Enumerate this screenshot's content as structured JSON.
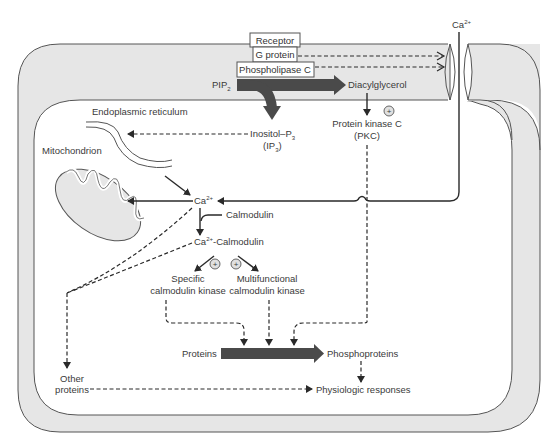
{
  "diagram": {
    "colors": {
      "membrane_band": "#e6e6e6",
      "outline": "#555555",
      "thick_arrow": "#4a4a4a",
      "text": "#3a3a3a"
    },
    "membrane_complex": {
      "receptor": "Receptor",
      "g_protein": "G protein",
      "phospholipase_c": "Phospholipase C"
    },
    "nodes": {
      "ca_extracellular": "Ca",
      "ca_extracellular_sup": "2+",
      "pip2": "PIP",
      "pip2_sub": "2",
      "diacylglycerol": "Diacylglycerol",
      "endoplasmic_reticulum": "Endoplasmic reticulum",
      "ip3_line1": "Inositol–P",
      "ip3_line1_sub": "3",
      "ip3_line2_open": "(IP",
      "ip3_line2_sub": "3",
      "ip3_line2_close": ")",
      "pkc_line1": "Protein kinase C",
      "pkc_line2": "(PKC)",
      "mitochondrion": "Mitochondrion",
      "ca_intracellular": "Ca",
      "ca_intracellular_sup": "2+",
      "calmodulin": "Calmodulin",
      "ca_calmodulin_pre": "Ca",
      "ca_calmodulin_sup": "2+",
      "ca_calmodulin_post": "-Calmodulin",
      "specific_kinase_line1": "Specific",
      "specific_kinase_line2": "calmodulin kinase",
      "multi_kinase_line1": "Multifunctional",
      "multi_kinase_line2": "calmodulin kinase",
      "proteins": "Proteins",
      "phosphoproteins": "Phosphoproteins",
      "other_proteins_line1": "Other",
      "other_proteins_line2": "proteins",
      "physiologic_responses": "Physiologic responses"
    },
    "activation_symbol": "+"
  }
}
